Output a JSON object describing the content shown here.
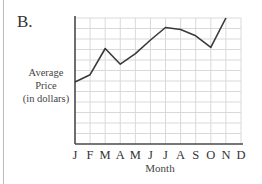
{
  "panel_label": "B.",
  "chart_data": {
    "type": "line",
    "title": "",
    "xlabel": "Month",
    "ylabel": "Average Price (in dollars)",
    "ylabel_lines": [
      "Average",
      "Price",
      "(in dollars)"
    ],
    "categories": [
      "J",
      "F",
      "M",
      "A",
      "M",
      "J",
      "J",
      "A",
      "S",
      "O",
      "N",
      "D"
    ],
    "series": [
      {
        "name": "Average Price",
        "x": [
          "J",
          "F",
          "M",
          "A",
          "M",
          "J",
          "J",
          "A",
          "S",
          "O",
          "N"
        ],
        "values": [
          5.9,
          6.6,
          9.1,
          7.6,
          8.6,
          9.9,
          11.1,
          10.9,
          10.3,
          9.2,
          12.0
        ]
      }
    ],
    "ylim": [
      0,
      12
    ],
    "y_units": "grid units (no numeric tick labels shown)",
    "grid": true,
    "legend": "none"
  },
  "colors": {
    "line": "#3a3a3a",
    "axis": "#4a4a4a",
    "grid": "#d9d9d9",
    "frame": "#bdbdbd"
  }
}
